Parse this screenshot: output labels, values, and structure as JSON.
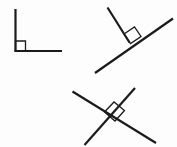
{
  "canvas": {
    "width": 177,
    "height": 147,
    "background_color": "#fdfdfd",
    "stroke_color": "#1b1b1b",
    "title": "Three right-angle figures"
  },
  "figures": [
    {
      "id": "figure-corner-left",
      "name": "right-angle-corner",
      "description": "L shaped right angle opening to the upper right",
      "stroke_width": 2.2,
      "segments": [
        {
          "name": "vertical-ray",
          "x1": 15.5,
          "y1": 9.0,
          "x2": 15.5,
          "y2": 51.5
        },
        {
          "name": "horizontal-ray",
          "x1": 14.5,
          "y1": 51.0,
          "x2": 62.0,
          "y2": 51.0
        }
      ],
      "angle_marker": {
        "name": "right-angle-square",
        "points": "15.5,41.0 25.5,41.0 25.5,51.0 15.5,51.0",
        "stroke_width": 1.3
      }
    },
    {
      "id": "figure-perpendicular-top-right",
      "name": "perpendicular-ray-on-line",
      "description": "A long diagonal line with a ray meeting it at a right angle",
      "stroke_width": 2.2,
      "segments": [
        {
          "name": "base-line",
          "x1": 95.0,
          "y1": 73.0,
          "x2": 173.0,
          "y2": 18.5
        },
        {
          "name": "perpendicular-ray",
          "x1": 107.5,
          "y1": 7.5,
          "x2": 129.5,
          "y2": 42.5
        }
      ],
      "angle_marker": {
        "name": "right-angle-square",
        "points": "124.0,34.0 134.5,27.0 141.0,36.5 130.5,43.5",
        "stroke_width": 1.3
      }
    },
    {
      "id": "figure-crossing-lines-bottom",
      "name": "crossed-perpendicular-lines",
      "description": "Two straight lines crossing at a right angle forming an X",
      "stroke_width": 2.2,
      "segments": [
        {
          "name": "line-nw-se",
          "x1": 72.5,
          "y1": 91.5,
          "x2": 156.0,
          "y2": 143.0
        },
        {
          "name": "line-sw-ne",
          "x1": 84.5,
          "y1": 145.0,
          "x2": 135.0,
          "y2": 88.0
        }
      ],
      "angle_marker": {
        "name": "right-angle-square",
        "points": "104.5,112.0 114.0,102.0 124.5,110.5 115.0,121.0",
        "stroke_width": 1.3
      }
    }
  ]
}
